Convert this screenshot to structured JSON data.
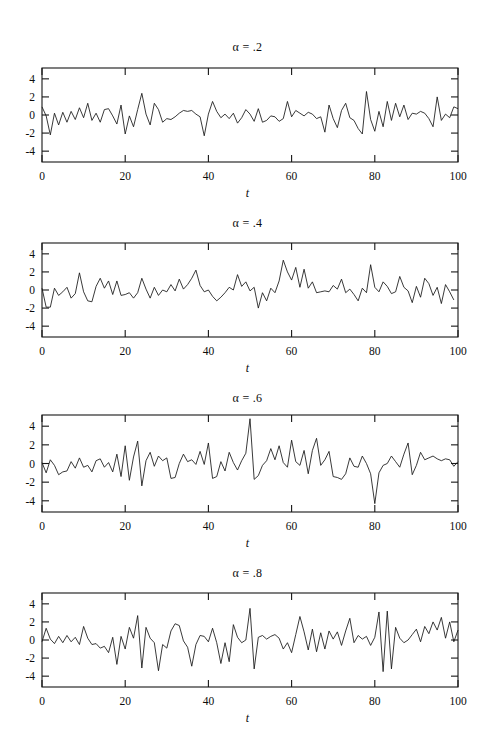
{
  "figure": {
    "width": 495,
    "height": 744,
    "background": "#ffffff",
    "ink_color": "#161616"
  },
  "chart_data": [
    {
      "type": "line",
      "title": "α = .2",
      "alpha": 0.2,
      "xlabel": "t",
      "ylabel": "",
      "xlim": [
        0,
        100
      ],
      "ylim": [
        -5.2,
        5.2
      ],
      "xticks": [
        0,
        20,
        40,
        60,
        80,
        100
      ],
      "yticks": [
        -4,
        -2,
        0,
        2,
        4
      ],
      "grid": false,
      "legend": null,
      "x": [
        0,
        1,
        2,
        3,
        4,
        5,
        6,
        7,
        8,
        9,
        10,
        11,
        12,
        13,
        14,
        15,
        16,
        17,
        18,
        19,
        20,
        21,
        22,
        23,
        24,
        25,
        26,
        27,
        28,
        29,
        30,
        31,
        32,
        33,
        34,
        35,
        36,
        37,
        38,
        39,
        40,
        41,
        42,
        43,
        44,
        45,
        46,
        47,
        48,
        49,
        50,
        51,
        52,
        53,
        54,
        55,
        56,
        57,
        58,
        59,
        60,
        61,
        62,
        63,
        64,
        65,
        66,
        67,
        68,
        69,
        70,
        71,
        72,
        73,
        74,
        75,
        76,
        77,
        78,
        79,
        80,
        81,
        82,
        83,
        84,
        85,
        86,
        87,
        88,
        89,
        90,
        91,
        92,
        93,
        94,
        95,
        96,
        97,
        98,
        99,
        100
      ],
      "values": [
        0.9,
        -0.1,
        -2.2,
        0.2,
        -1.1,
        0.3,
        -0.8,
        0.4,
        -0.5,
        0.8,
        -0.3,
        1.3,
        -0.6,
        0.2,
        -0.8,
        0.6,
        0.7,
        -0.1,
        -1.0,
        1.1,
        -2.1,
        -0.1,
        -1.3,
        0.6,
        2.4,
        0.1,
        -1.1,
        1.3,
        0.6,
        -0.8,
        -0.4,
        -0.5,
        -0.2,
        0.2,
        0.5,
        0.4,
        0.5,
        0.1,
        -0.2,
        -2.3,
        0.1,
        1.5,
        0.4,
        -0.3,
        0.1,
        -0.4,
        0.2,
        -0.9,
        -0.3,
        0.6,
        0.1,
        -0.7,
        0.7,
        -0.8,
        -0.6,
        -0.1,
        -0.2,
        -0.7,
        -0.4,
        1.5,
        -0.2,
        0.5,
        0.2,
        -0.1,
        0.3,
        0.1,
        -0.4,
        -0.2,
        -1.9,
        1.1,
        -0.4,
        -1.4,
        0.5,
        1.3,
        -0.3,
        -0.6,
        -1.5,
        -2.1,
        2.6,
        -0.5,
        -1.8,
        0.4,
        -1.3,
        1.5,
        -0.6,
        1.3,
        -0.2,
        1.1,
        -0.5,
        0.2,
        0.1,
        0.4,
        0.2,
        -0.4,
        -1.3,
        2.0,
        -0.6,
        0.1,
        -0.3,
        0.9,
        0.7,
        -1.1
      ]
    },
    {
      "type": "line",
      "title": "α = .4",
      "alpha": 0.4,
      "xlabel": "t",
      "ylabel": "",
      "xlim": [
        0,
        100
      ],
      "ylim": [
        -5.2,
        5.2
      ],
      "xticks": [
        0,
        20,
        40,
        60,
        80,
        100
      ],
      "yticks": [
        -4,
        -2,
        0,
        2,
        4
      ],
      "grid": false,
      "legend": null,
      "x": [
        0,
        1,
        2,
        3,
        4,
        5,
        6,
        7,
        8,
        9,
        10,
        11,
        12,
        13,
        14,
        15,
        16,
        17,
        18,
        19,
        20,
        21,
        22,
        23,
        24,
        25,
        26,
        27,
        28,
        29,
        30,
        31,
        32,
        33,
        34,
        35,
        36,
        37,
        38,
        39,
        40,
        41,
        42,
        43,
        44,
        45,
        46,
        47,
        48,
        49,
        50,
        51,
        52,
        53,
        54,
        55,
        56,
        57,
        58,
        59,
        60,
        61,
        62,
        63,
        64,
        65,
        66,
        67,
        68,
        69,
        70,
        71,
        72,
        73,
        74,
        75,
        76,
        77,
        78,
        79,
        80,
        81,
        82,
        83,
        84,
        85,
        86,
        87,
        88,
        89,
        90,
        91,
        92,
        93,
        94,
        95,
        96,
        97,
        98,
        99,
        100
      ],
      "values": [
        0.2,
        -1.9,
        -1.9,
        0.2,
        -0.6,
        -0.2,
        0.3,
        -0.9,
        -0.4,
        1.9,
        -0.2,
        -1.2,
        -1.3,
        0.4,
        1.3,
        0.2,
        1.0,
        -0.5,
        1.0,
        -0.6,
        -0.5,
        -0.3,
        -0.9,
        -0.3,
        1.3,
        0.1,
        -0.9,
        0.3,
        -0.6,
        0.0,
        -0.2,
        0.6,
        -0.1,
        1.2,
        0.1,
        0.6,
        1.3,
        2.2,
        0.5,
        -0.2,
        0.0,
        -0.7,
        -1.2,
        -0.8,
        -0.3,
        0.3,
        0.0,
        1.7,
        0.4,
        0.9,
        -0.1,
        0.3,
        -2.0,
        -0.3,
        -1.2,
        0.2,
        -0.3,
        1.0,
        3.3,
        2.0,
        1.1,
        2.5,
        0.3,
        2.3,
        0.2,
        0.9,
        -0.3,
        -0.2,
        -0.1,
        -0.2,
        0.5,
        0.1,
        1.2,
        -0.3,
        0.1,
        -0.5,
        -1.2,
        0.2,
        -0.3,
        2.8,
        0.3,
        -0.2,
        0.9,
        0.4,
        -0.4,
        -0.2,
        1.5,
        0.3,
        -0.1,
        -1.4,
        0.4,
        -0.8,
        1.3,
        0.7,
        -0.6,
        0.3,
        -1.5,
        0.6,
        -0.2,
        -1.1
      ]
    },
    {
      "type": "line",
      "title": "α = .6",
      "alpha": 0.6,
      "xlabel": "t",
      "ylabel": "",
      "xlim": [
        0,
        100
      ],
      "ylim": [
        -5.2,
        5.2
      ],
      "xticks": [
        0,
        20,
        40,
        60,
        80,
        100
      ],
      "yticks": [
        -4,
        -2,
        0,
        2,
        4
      ],
      "grid": false,
      "legend": null,
      "x": [
        0,
        1,
        2,
        3,
        4,
        5,
        6,
        7,
        8,
        9,
        10,
        11,
        12,
        13,
        14,
        15,
        16,
        17,
        18,
        19,
        20,
        21,
        22,
        23,
        24,
        25,
        26,
        27,
        28,
        29,
        30,
        31,
        32,
        33,
        34,
        35,
        36,
        37,
        38,
        39,
        40,
        41,
        42,
        43,
        44,
        45,
        46,
        47,
        48,
        49,
        50,
        51,
        52,
        53,
        54,
        55,
        56,
        57,
        58,
        59,
        60,
        61,
        62,
        63,
        64,
        65,
        66,
        67,
        68,
        69,
        70,
        71,
        72,
        73,
        74,
        75,
        76,
        77,
        78,
        79,
        80,
        81,
        82,
        83,
        84,
        85,
        86,
        87,
        88,
        89,
        90,
        91,
        92,
        93,
        94,
        95,
        96,
        97,
        98,
        99,
        100
      ],
      "values": [
        0.1,
        -1.0,
        0.4,
        -0.2,
        -1.2,
        -0.9,
        -0.8,
        0.2,
        -0.5,
        0.6,
        -0.4,
        -0.2,
        -0.9,
        0.3,
        0.5,
        -0.4,
        0.1,
        -0.9,
        1.0,
        -1.4,
        1.9,
        -1.8,
        0.7,
        2.4,
        -2.4,
        0.3,
        1.2,
        -0.3,
        0.8,
        0.3,
        0.6,
        -1.6,
        -1.5,
        0.0,
        1.0,
        0.2,
        0.4,
        -0.1,
        1.3,
        -0.1,
        2.2,
        -1.6,
        -1.4,
        0.2,
        -0.8,
        1.2,
        0.1,
        -0.7,
        0.3,
        1.1,
        4.8,
        -1.7,
        -1.3,
        -0.2,
        0.3,
        1.6,
        0.4,
        1.9,
        0.1,
        -0.4,
        2.5,
        0.2,
        -0.2,
        1.4,
        -1.1,
        1.4,
        2.7,
        -0.2,
        0.4,
        1.3,
        -1.4,
        -1.5,
        -1.7,
        -1.1,
        0.6,
        -0.3,
        -0.4,
        0.8,
        0.0,
        -1.1,
        -4.3,
        -1.0,
        -0.2,
        0.0,
        0.8,
        0.2,
        -0.4,
        1.0,
        2.2,
        -1.2,
        -0.2,
        1.2,
        0.4,
        0.6,
        0.8,
        0.5,
        0.3,
        0.5,
        0.4,
        -0.3,
        0.2
      ]
    },
    {
      "type": "line",
      "title": "α = .8",
      "alpha": 0.8,
      "xlabel": "t",
      "ylabel": "",
      "xlim": [
        0,
        100
      ],
      "ylim": [
        -5.2,
        5.2
      ],
      "xticks": [
        0,
        20,
        40,
        60,
        80,
        100
      ],
      "yticks": [
        -4,
        -2,
        0,
        2,
        4
      ],
      "grid": false,
      "legend": null,
      "x": [
        0,
        1,
        2,
        3,
        4,
        5,
        6,
        7,
        8,
        9,
        10,
        11,
        12,
        13,
        14,
        15,
        16,
        17,
        18,
        19,
        20,
        21,
        22,
        23,
        24,
        25,
        26,
        27,
        28,
        29,
        30,
        31,
        32,
        33,
        34,
        35,
        36,
        37,
        38,
        39,
        40,
        41,
        42,
        43,
        44,
        45,
        46,
        47,
        48,
        49,
        50,
        51,
        52,
        53,
        54,
        55,
        56,
        57,
        58,
        59,
        60,
        61,
        62,
        63,
        64,
        65,
        66,
        67,
        68,
        69,
        70,
        71,
        72,
        73,
        74,
        75,
        76,
        77,
        78,
        79,
        80,
        81,
        82,
        83,
        84,
        85,
        86,
        87,
        88,
        89,
        90,
        91,
        92,
        93,
        94,
        95,
        96,
        97,
        98,
        99,
        100
      ],
      "values": [
        -0.2,
        1.3,
        0.1,
        -0.4,
        0.4,
        -0.3,
        0.5,
        -0.2,
        0.3,
        -0.5,
        1.5,
        0.2,
        -0.5,
        -0.4,
        -0.9,
        -0.7,
        -1.4,
        0.3,
        -2.7,
        0.4,
        -1.0,
        1.4,
        0.2,
        2.7,
        -3.1,
        1.4,
        0.2,
        -0.3,
        -3.4,
        -0.5,
        -0.9,
        1.0,
        1.8,
        1.6,
        -0.1,
        -0.8,
        -2.9,
        -0.5,
        0.5,
        0.4,
        -0.2,
        1.3,
        -0.3,
        -2.6,
        -0.3,
        -2.4,
        1.7,
        0.3,
        -0.3,
        0.0,
        3.5,
        -3.2,
        0.3,
        0.5,
        0.1,
        0.4,
        0.6,
        0.2,
        -1.0,
        -0.3,
        -1.4,
        0.6,
        2.6,
        0.9,
        -1.1,
        1.2,
        -1.3,
        0.8,
        -1.0,
        1.0,
        0.1,
        0.9,
        -0.6,
        1.0,
        2.4,
        -0.3,
        0.5,
        0.1,
        0.4,
        -0.6,
        0.3,
        3.1,
        -3.5,
        3.2,
        -3.2,
        1.4,
        0.2,
        -0.3,
        0.0,
        0.6,
        1.2,
        -0.2,
        1.5,
        0.7,
        2.0,
        1.1,
        2.5,
        0.2,
        2.0,
        -0.2,
        1.1
      ]
    }
  ]
}
